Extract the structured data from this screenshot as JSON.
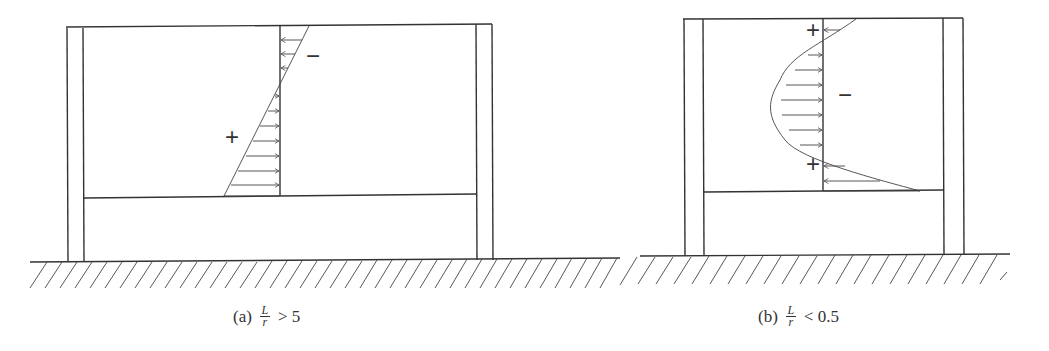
{
  "figures": [
    {
      "id": "a",
      "caption_label": "(a)",
      "ratio_numerator": "L",
      "ratio_denominator": "r",
      "ratio_relation": "> 5",
      "signs": {
        "top": "−",
        "bottom": "+"
      }
    },
    {
      "id": "b",
      "caption_label": "(b)",
      "ratio_numerator": "L",
      "ratio_denominator": "r",
      "ratio_relation": "< 0.5",
      "signs": {
        "top": "+",
        "middle": "−",
        "bottom": "+"
      }
    }
  ],
  "colors": {
    "line": "#333333",
    "background": "#ffffff"
  }
}
